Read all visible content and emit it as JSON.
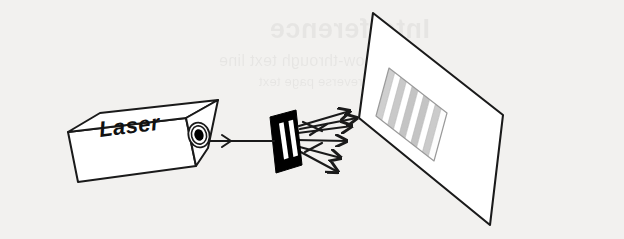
{
  "figure": {
    "background_color": "#f2f1ef",
    "ink_color": "#1a1a1a",
    "width": 624,
    "height": 239
  },
  "ghost_text": {
    "note": "faint show-through text from reverse of scanned page, illegible",
    "line1": "Interference",
    "line2": "show-through text line",
    "line3": "faint reverse page text"
  },
  "laser": {
    "label": "Laser",
    "body_fill": "#ffffff",
    "aperture_fill": "#000000",
    "outline_color": "#1a1a1a"
  },
  "beam": {
    "name": "incident-beam",
    "arrow_marker": "arrowhead",
    "color": "#1a1a1a"
  },
  "slit_plate": {
    "name": "double-slit-plate",
    "fill": "#000000",
    "slit_count": 2,
    "slit_fill": "#ffffff"
  },
  "diffracted_rays": {
    "count": 6,
    "color": "#1a1a1a"
  },
  "screen": {
    "name": "viewing-screen",
    "fill": "#ffffff",
    "outline_color": "#1a1a1a"
  },
  "fringe_pattern": {
    "name": "interference-fringes",
    "band_count": 10,
    "bright_color": "#ffffff",
    "dim_color": "#c9c9c9",
    "bands": [
      {
        "index": 0,
        "type": "dim",
        "shade": "#cfcfcf"
      },
      {
        "index": 1,
        "type": "bright",
        "shade": "#ffffff"
      },
      {
        "index": 2,
        "type": "dim",
        "shade": "#c9c9c9"
      },
      {
        "index": 3,
        "type": "bright",
        "shade": "#ffffff"
      },
      {
        "index": 4,
        "type": "dim",
        "shade": "#c4c4c4"
      },
      {
        "index": 5,
        "type": "bright",
        "shade": "#ffffff"
      },
      {
        "index": 6,
        "type": "dim",
        "shade": "#c4c4c4"
      },
      {
        "index": 7,
        "type": "bright",
        "shade": "#ffffff"
      },
      {
        "index": 8,
        "type": "dim",
        "shade": "#cbcbcb"
      },
      {
        "index": 9,
        "type": "bright",
        "shade": "#fdfdfd"
      }
    ]
  }
}
